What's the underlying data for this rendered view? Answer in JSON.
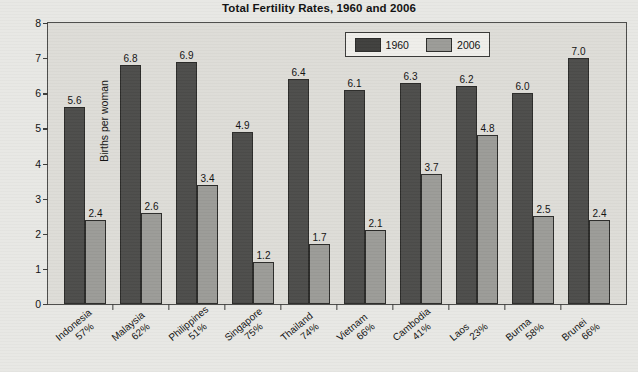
{
  "chart_data": {
    "type": "bar",
    "title": "Total Fertility Rates, 1960 and 2006",
    "xlabel": "",
    "ylabel": "Births per woman",
    "ylim": [
      0,
      8
    ],
    "yticks": [
      "0",
      "1",
      "2",
      "3",
      "4",
      "5",
      "6",
      "7",
      "8"
    ],
    "grid": false,
    "legend_position": "top-center-right",
    "categories": [
      "Indonesia",
      "Malaysia",
      "Philippines",
      "Singapore",
      "Thailand",
      "Vietnam",
      "Cambodia",
      "Laos",
      "Burma",
      "Brunei"
    ],
    "category_sublabels": [
      "57%",
      "62%",
      "51%",
      "75%",
      "74%",
      "66%",
      "41%",
      "23%",
      "58%",
      "66%"
    ],
    "series": [
      {
        "name": "1960",
        "color": "#4c4c4a",
        "values": [
          5.6,
          6.8,
          6.9,
          4.9,
          6.4,
          6.1,
          6.3,
          6.2,
          6.0,
          7.0
        ],
        "labels": [
          "5.6",
          "6.8",
          "6.9",
          "4.9",
          "6.4",
          "6.1",
          "6.3",
          "6.2",
          "6.0",
          "7.0"
        ]
      },
      {
        "name": "2006",
        "color": "#9b9b97",
        "values": [
          2.4,
          2.6,
          3.4,
          1.2,
          1.7,
          2.1,
          3.7,
          4.8,
          2.5,
          2.4
        ],
        "labels": [
          "2.4",
          "2.6",
          "3.4",
          "1.2",
          "1.7",
          "2.1",
          "3.7",
          "4.8",
          "2.5",
          "2.4"
        ]
      }
    ]
  },
  "legend": {
    "items": [
      {
        "label": "1960",
        "swatch": "dark-swatch-icon"
      },
      {
        "label": "2006",
        "swatch": "light-swatch-icon"
      }
    ]
  }
}
